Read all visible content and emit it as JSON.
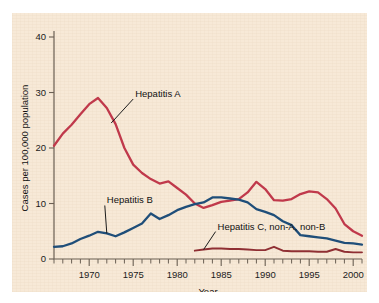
{
  "chart_data": {
    "type": "line",
    "title": "",
    "xlabel": "Year",
    "ylabel": "Cases per 100,000 population",
    "xlim": [
      1966,
      2001
    ],
    "ylim": [
      0,
      40
    ],
    "yticks": [
      0,
      10,
      20,
      30,
      40
    ],
    "xticks": [
      1970,
      1975,
      1980,
      1985,
      1990,
      1995,
      2000
    ],
    "xtick_labels": [
      "1970",
      "1975",
      "1980",
      "1985",
      "1990",
      "1995",
      "2000"
    ],
    "ytick_labels": [
      "0",
      "10",
      "20",
      "30",
      "40"
    ],
    "minor_tick_interval": 1,
    "grid": false,
    "legend_position": "inline-annotations",
    "series": [
      {
        "name": "Hepatitis A",
        "color": "#c0394b",
        "x": [
          1966,
          1967,
          1968,
          1969,
          1970,
          1971,
          1972,
          1973,
          1974,
          1975,
          1976,
          1977,
          1978,
          1979,
          1980,
          1981,
          1982,
          1983,
          1984,
          1985,
          1986,
          1987,
          1988,
          1989,
          1990,
          1991,
          1992,
          1993,
          1994,
          1995,
          1996,
          1997,
          1998,
          1999,
          2000,
          2001
        ],
        "y": [
          20.4,
          22.6,
          24.2,
          26.1,
          27.9,
          29.0,
          27.2,
          24.3,
          20.0,
          17.0,
          15.5,
          14.4,
          13.6,
          14.0,
          12.8,
          11.6,
          10.0,
          9.2,
          9.7,
          10.3,
          10.5,
          10.8,
          12.0,
          13.9,
          12.6,
          10.6,
          10.5,
          10.8,
          11.7,
          12.2,
          12.0,
          10.8,
          9.1,
          6.3,
          5.0,
          4.2
        ]
      },
      {
        "name": "Hepatitis B",
        "color": "#1f4e79",
        "x": [
          1966,
          1967,
          1968,
          1969,
          1970,
          1971,
          1972,
          1973,
          1974,
          1975,
          1976,
          1977,
          1978,
          1979,
          1980,
          1981,
          1982,
          1983,
          1984,
          1985,
          1986,
          1987,
          1988,
          1989,
          1990,
          1991,
          1992,
          1993,
          1994,
          1995,
          1996,
          1997,
          1998,
          1999,
          2000,
          2001
        ],
        "y": [
          2.2,
          2.3,
          2.8,
          3.6,
          4.2,
          4.9,
          4.6,
          4.1,
          4.8,
          5.6,
          6.4,
          8.2,
          7.2,
          7.9,
          8.8,
          9.4,
          9.9,
          10.2,
          11.1,
          11.1,
          10.9,
          10.7,
          10.2,
          9.0,
          8.5,
          7.9,
          6.8,
          6.1,
          4.3,
          4.1,
          3.9,
          3.7,
          3.3,
          2.9,
          2.8,
          2.6
        ]
      },
      {
        "name": "Hepatitis C, non-A, non-B",
        "color": "#8f2f33",
        "x": [
          1982,
          1983,
          1984,
          1985,
          1986,
          1987,
          1988,
          1989,
          1990,
          1991,
          1992,
          1993,
          1994,
          1995,
          1996,
          1997,
          1998,
          1999,
          2000,
          2001
        ],
        "y": [
          1.5,
          1.7,
          1.9,
          1.9,
          1.8,
          1.8,
          1.7,
          1.6,
          1.6,
          2.2,
          1.5,
          1.4,
          1.4,
          1.4,
          1.3,
          1.3,
          1.8,
          1.3,
          1.2,
          1.2
        ]
      }
    ],
    "annotations": [
      {
        "text": "Hepatitis A",
        "target_x": 1972.5,
        "target_y": 24.5
      },
      {
        "text": "Hepatitis B",
        "target_x": 1972.0,
        "target_y": 4.6
      },
      {
        "text": "Hepatitis C, non-A, non-B",
        "target_x": 1983.0,
        "target_y": 1.7
      }
    ],
    "colors": {
      "panel_background": "#f7e9d7",
      "page_background": "#ffffff",
      "axis": "#6b6054",
      "text": "#111111"
    }
  }
}
